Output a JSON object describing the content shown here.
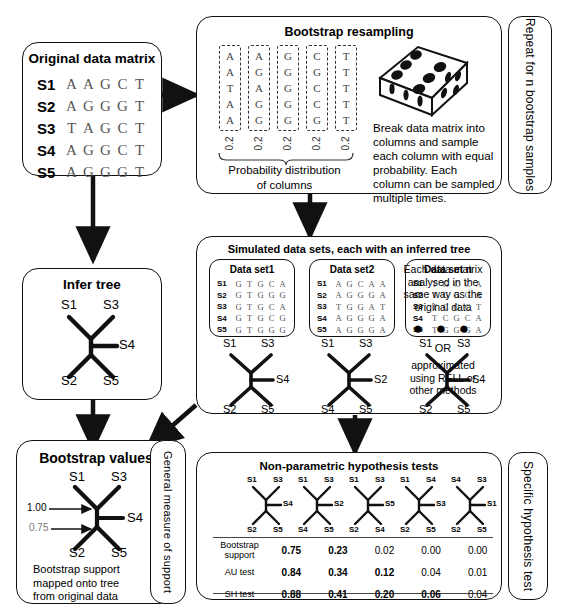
{
  "original": {
    "title": "Original data matrix",
    "rows": [
      {
        "id": "S1",
        "seq": "AAGCT"
      },
      {
        "id": "S2",
        "seq": "AGGGT"
      },
      {
        "id": "S3",
        "seq": "TAGCT"
      },
      {
        "id": "S4",
        "seq": "AGGCT"
      },
      {
        "id": "S5",
        "seq": "AGGGT"
      }
    ]
  },
  "bootstrap_panel": {
    "title": "Bootstrap resampling",
    "columns": [
      "AATAA",
      "AGAGG",
      "GGGGG",
      "CGCCG",
      "TTTTT"
    ],
    "probabilities": [
      "0.2",
      "0.2",
      "0.2",
      "0.2",
      "0.2"
    ],
    "brace_label_line1": "Probability distribution",
    "brace_label_line2": "of columns",
    "dice_icon": "die-six-icon",
    "description": "Break data matrix into columns and sample each column with equal probability. Each column can be sampled multiple times.",
    "side_tab": "Repeat for n bootstrap samples"
  },
  "infer_tree": {
    "title": "Infer tree",
    "tree": {
      "top_left": "S1",
      "top_right": "S3",
      "right": "S4",
      "bottom_left": "S2",
      "bottom_right": "S5"
    }
  },
  "simulated": {
    "title": "Simulated data sets, each with an inferred tree",
    "datasets": [
      {
        "title": "Data set1",
        "rows": [
          {
            "id": "S1",
            "seq": "GTGCA"
          },
          {
            "id": "S2",
            "seq": "GTGGG"
          },
          {
            "id": "S3",
            "seq": "GTGCA"
          },
          {
            "id": "S4",
            "seq": "GTGCG"
          },
          {
            "id": "S5",
            "seq": "GTGGG"
          }
        ],
        "tree": {
          "top_left": "S1",
          "top_right": "S3",
          "right": "S4",
          "bottom_left": "S2",
          "bottom_right": "S5"
        }
      },
      {
        "title": "Data set2",
        "rows": [
          {
            "id": "S1",
            "seq": "AGCAA"
          },
          {
            "id": "S2",
            "seq": "AGGGA"
          },
          {
            "id": "S3",
            "seq": "TGGAT"
          },
          {
            "id": "S4",
            "seq": "AGGGA"
          },
          {
            "id": "S5",
            "seq": "AGGGA"
          }
        ],
        "tree": {
          "top_left": "S1",
          "top_right": "S3",
          "right": "S2",
          "bottom_left": "S4",
          "bottom_right": "S5"
        }
      },
      {
        "title": "Data set n",
        "rows": [
          {
            "id": "S1",
            "seq": "TGCCA"
          },
          {
            "id": "S2",
            "seq": "TGGGA"
          },
          {
            "id": "S3",
            "seq": "TCGCT"
          },
          {
            "id": "S4",
            "seq": "TCGCA"
          },
          {
            "id": "S5",
            "seq": "TGGGA"
          }
        ],
        "tree": {
          "top_left": "S1",
          "top_right": "S3",
          "right": "S4",
          "bottom_left": "S2",
          "bottom_right": "S5"
        }
      }
    ],
    "note_line1": "Each data matrix",
    "note_line2": "analysed in the",
    "note_line3": "same way as the",
    "note_line4": "original data",
    "ellipsis": "● ● ●",
    "or_label": "OR",
    "alt_line1": "approximated",
    "alt_line2": "using RELL or",
    "alt_line3": "other methods"
  },
  "bootstrap_values": {
    "title": "Bootstrap values",
    "tree": {
      "top_left": "S1",
      "top_right": "S3",
      "right": "S4",
      "bottom_left": "S2",
      "bottom_right": "S5"
    },
    "support_upper": "1.00",
    "support_lower": "0.75",
    "caption_line1": "Bootstrap support",
    "caption_line2": "mapped onto tree",
    "caption_line3": "from original data",
    "side_tab": "General measure of support"
  },
  "hypothesis": {
    "title": "Non-parametric hypothesis tests",
    "side_tab": "Specific hypothesis test",
    "trees": [
      {
        "top_left": "S1",
        "top_right": "S3",
        "right": "S4",
        "bottom_left": "S2",
        "bottom_right": "S5"
      },
      {
        "top_left": "S1",
        "top_right": "S3",
        "right": "S2",
        "bottom_left": "S4",
        "bottom_right": "S5"
      },
      {
        "top_left": "S1",
        "top_right": "S3",
        "right": "S5",
        "bottom_left": "S2",
        "bottom_right": "S4"
      },
      {
        "top_left": "S1",
        "top_right": "S4",
        "right": "S3",
        "bottom_left": "S2",
        "bottom_right": "S5"
      },
      {
        "top_left": "S4",
        "top_right": "S3",
        "right": "S1",
        "bottom_left": "S2",
        "bottom_right": "S5"
      }
    ],
    "table": {
      "rows": [
        {
          "label_line1": "Bootstrap",
          "label_line2": "support",
          "values": [
            "0.75",
            "0.23",
            "0.02",
            "0.00",
            "0.00"
          ],
          "bold": [
            true,
            true,
            false,
            false,
            false
          ]
        },
        {
          "label_line1": "AU test",
          "label_line2": "",
          "values": [
            "0.84",
            "0.34",
            "0.12",
            "0.04",
            "0.01"
          ],
          "bold": [
            true,
            true,
            true,
            false,
            false
          ]
        },
        {
          "label_line1": "SH test",
          "label_line2": "",
          "values": [
            "0.88",
            "0.41",
            "0.20",
            "0.06",
            "0.04"
          ],
          "bold": [
            true,
            true,
            true,
            true,
            false
          ]
        }
      ]
    }
  },
  "colors": {
    "line": "#111111",
    "text": "#000000",
    "seq": "#555555"
  }
}
